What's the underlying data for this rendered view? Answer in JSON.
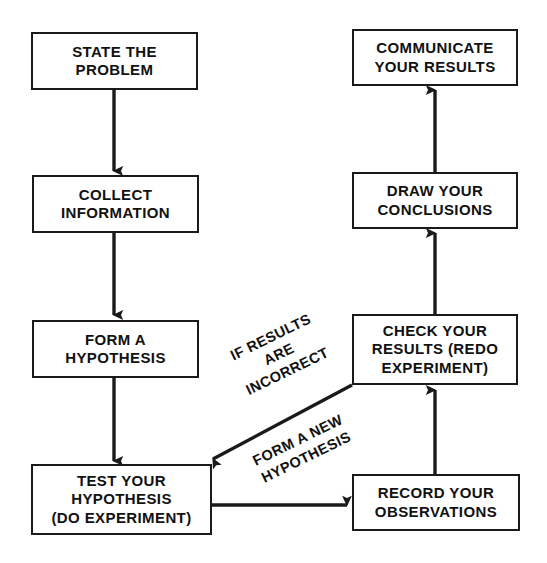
{
  "diagram": {
    "background_color": "#ffffff",
    "line_color": "#1a1a1a",
    "text_color": "#111111",
    "nodes": [
      {
        "id": "state-the-problem",
        "label": "STATE THE\nPROBLEM"
      },
      {
        "id": "collect-information",
        "label": "COLLECT\nINFORMATION"
      },
      {
        "id": "form-a-hypothesis",
        "label": "FORM A\nHYPOTHESIS"
      },
      {
        "id": "test-your-hypothesis",
        "label": "TEST YOUR\nHYPOTHESIS\n(DO EXPERIMENT)"
      },
      {
        "id": "record-your-observations",
        "label": "RECORD YOUR\nOBSERVATIONS"
      },
      {
        "id": "check-your-results",
        "label": "CHECK YOUR\nRESULTS (REDO\nEXPERIMENT)"
      },
      {
        "id": "draw-your-conclusions",
        "label": "DRAW YOUR\nCONCLUSIONS"
      },
      {
        "id": "communicate-your-results",
        "label": "COMMUNICATE\nYOUR RESULTS"
      }
    ],
    "edge_labels": [
      {
        "id": "if-results-incorrect",
        "label": "IF RESULTS\nARE\nINCORRECT"
      },
      {
        "id": "form-a-new-hypothesis",
        "label": "FORM A NEW\nHYPOTHESIS"
      }
    ]
  }
}
